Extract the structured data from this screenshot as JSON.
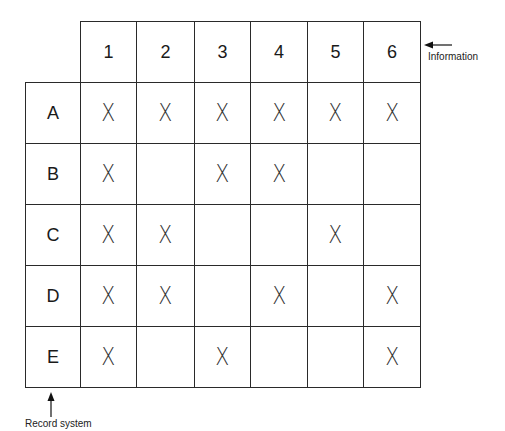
{
  "matrix": {
    "columns": [
      "1",
      "2",
      "3",
      "4",
      "5",
      "6"
    ],
    "rows": [
      {
        "label": "A",
        "marks": [
          "X",
          "X",
          "X",
          "X",
          "X",
          "X"
        ]
      },
      {
        "label": "B",
        "marks": [
          "X",
          "",
          "X",
          "X",
          "",
          ""
        ]
      },
      {
        "label": "C",
        "marks": [
          "X",
          "X",
          "",
          "",
          "X",
          ""
        ]
      },
      {
        "label": "D",
        "marks": [
          "X",
          "X",
          "",
          "X",
          "",
          "X"
        ]
      },
      {
        "label": "E",
        "marks": [
          "X",
          "",
          "X",
          "",
          "",
          "X"
        ]
      }
    ]
  },
  "annotations": {
    "columns_label": "Information",
    "rows_label": "Record system"
  },
  "colors": {
    "line": "#2a2a2a",
    "background": "#ffffff"
  }
}
